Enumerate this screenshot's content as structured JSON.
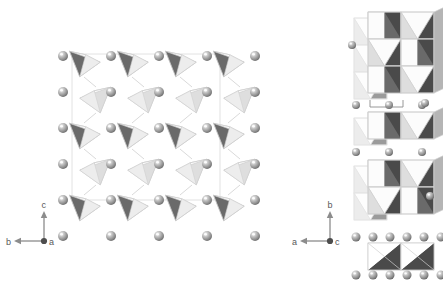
{
  "figure": {
    "type": "crystal-structure-projection",
    "background": "#ffffff",
    "width": 443,
    "height": 286,
    "panel_count": 2
  },
  "colors": {
    "background": "#ffffff",
    "atom_sphere_fill": "#9a9a9a",
    "atom_sphere_highlight": "#f2f2f2",
    "atom_sphere_shadow": "#6e6e6e",
    "polyhedron_edge": "#cfcfcf",
    "face_light": "#f7f7f7",
    "face_mid": "#b5b5b5",
    "face_dark": "#6a6a6a",
    "face_darkest": "#4a4a4a",
    "face_pale": "#dedede",
    "axis_line": "#8c8c8c",
    "axis_text": "#595959",
    "unitcell_line": "#a8a8a8"
  },
  "left_panel": {
    "name": "main-projection",
    "description": "Projection down the a-axis showing zigzag chains of corner-sharing tetrahedra between rows of cation spheres",
    "origin": {
      "x": 48,
      "y": 10
    },
    "axes": {
      "name": "axis-triad-left",
      "origin": {
        "x": 44,
        "y": 241
      },
      "up_label": "c",
      "left_label": "b",
      "out_of_page_label": "a",
      "up_length": 26,
      "left_length": 26
    },
    "sphere_grid": {
      "label": "cation-sites",
      "columns": 5,
      "rows": 6,
      "x_start": 63,
      "y_start": 56,
      "x_step": 48,
      "y_step": 36,
      "radius": 5
    },
    "tetra_columns": 4,
    "tetra_rows": 5,
    "tetra_x_start": 88,
    "tetra_y_start": 63,
    "tetra_x_step": 48,
    "tetra_y_step": 36
  },
  "right_panel": {
    "name": "side-projections",
    "description": "Projection down the c-axis showing three stacked slabs of edge-sharing polyhedra separated by rows of cation spheres, plus an isolated lower slab",
    "axes": {
      "name": "axis-triad-right",
      "origin": {
        "x": 330,
        "y": 241
      },
      "up_label": "b",
      "left_label": "a",
      "out_of_page_label": "c",
      "up_length": 26,
      "left_length": 26
    },
    "blocks": [
      {
        "name": "slab-top",
        "x": 368,
        "y": 12,
        "cols": 2,
        "rows": 3,
        "cell_w": 33,
        "cell_h": 27,
        "has_back_layer": true
      },
      {
        "name": "slab-middle",
        "x": 368,
        "y": 112,
        "cols": 2,
        "rows": 1,
        "cell_w": 33,
        "cell_h": 27,
        "has_back_layer": true
      },
      {
        "name": "slab-lower",
        "x": 368,
        "y": 160,
        "cols": 2,
        "rows": 2,
        "cell_w": 33,
        "cell_h": 27,
        "has_back_layer": true
      },
      {
        "name": "slab-bottom",
        "x": 368,
        "y": 243,
        "cols": 2,
        "rows": 1,
        "cell_w": 33,
        "cell_h": 27,
        "has_back_layer": false
      }
    ],
    "sphere_rows": [
      {
        "name": "sphere-row-1",
        "y": 105,
        "x_start": 356,
        "count": 3,
        "x_step": 33,
        "radius": 4
      },
      {
        "name": "sphere-row-2",
        "y": 152,
        "x_start": 356,
        "count": 3,
        "x_step": 33,
        "radius": 4
      },
      {
        "name": "sphere-row-3",
        "y": 237,
        "x_start": 356,
        "count": 6,
        "x_step": 17,
        "radius": 4.5
      },
      {
        "name": "sphere-row-4",
        "y": 275,
        "x_start": 356,
        "count": 6,
        "x_step": 17,
        "radius": 4.5
      }
    ],
    "stray_spheres": [
      {
        "name": "stray-sphere-upper-left",
        "x": 352,
        "y": 45,
        "radius": 4
      },
      {
        "name": "stray-sphere-mid-right",
        "x": 425,
        "y": 103,
        "radius": 4
      },
      {
        "name": "stray-sphere-lower-right",
        "x": 430,
        "y": 196,
        "radius": 4
      }
    ],
    "measure_bar": {
      "name": "unit-cell-measure-bar",
      "x1": 370,
      "x2": 403,
      "y": 107,
      "tick_height": 7
    }
  }
}
